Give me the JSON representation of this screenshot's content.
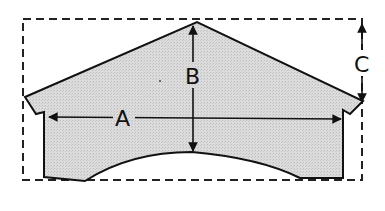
{
  "diagram": {
    "type": "roof-dimension-sketch",
    "colors": {
      "fill": "#d6d6d6",
      "stroke": "#111111",
      "background": "#ffffff"
    },
    "labels": {
      "a": "A",
      "b": "B",
      "c": "C"
    },
    "dimensions": [
      {
        "id": "A",
        "description": "width between inner walls",
        "orientation": "horizontal"
      },
      {
        "id": "B",
        "description": "height from arch top to roof peak",
        "orientation": "vertical"
      },
      {
        "id": "C",
        "description": "height from eave to peak level",
        "orientation": "vertical"
      }
    ]
  }
}
